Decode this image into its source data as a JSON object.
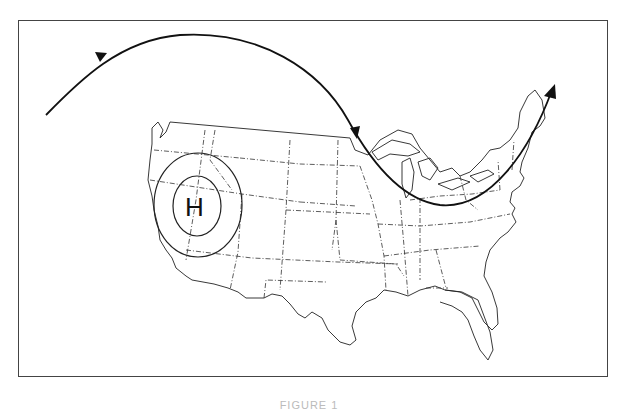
{
  "figure": {
    "type": "weather map",
    "region": "contiguous United States",
    "pressure_center": {
      "label": "H",
      "meaning": "high pressure",
      "location": "Nevada / Utah (Great Basin)"
    },
    "features": {
      "jet_stream": "arrowed curved line: from Pacific northwest up over Canada, dipping south over Great Lakes, exiting northeast over New England",
      "isobars": 2
    },
    "caption": "FIGURE 1"
  }
}
